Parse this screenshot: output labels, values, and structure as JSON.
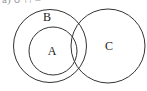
{
  "header_fragment": "a) ∪ ∩ =",
  "diagram": {
    "type": "venn",
    "stroke_color": "#333333",
    "sets": [
      {
        "label": "B",
        "cx": 50,
        "cy": 46,
        "r": 36.5,
        "label_x": 47,
        "label_y": 21
      },
      {
        "label": "A",
        "cx": 53,
        "cy": 51,
        "r": 24,
        "label_x": 52,
        "label_y": 55
      },
      {
        "label": "C",
        "cx": 108,
        "cy": 46,
        "r": 37,
        "label_x": 109,
        "label_y": 48
      }
    ],
    "relations": [
      "A ⊂ B",
      "B ∩ C ≠ ∅",
      "A ∩ C ≠ ∅"
    ]
  }
}
